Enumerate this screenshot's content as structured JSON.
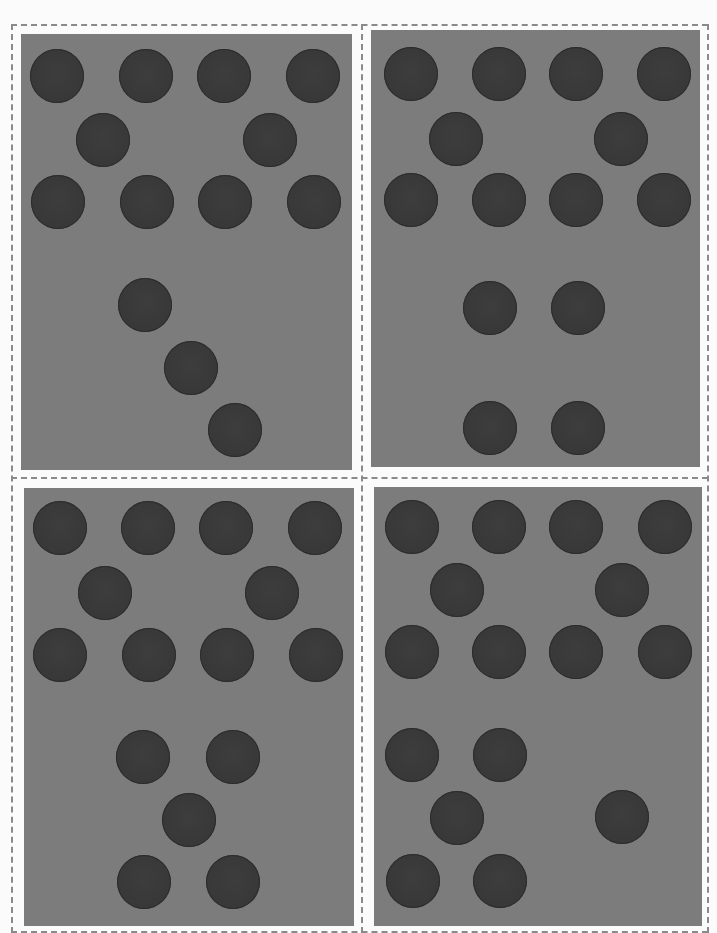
{
  "page": {
    "background": "#fbfbfb",
    "cut_line_color": "#8a8a8a",
    "card_color": "#7c7c7c",
    "dot_color": "#3a3a3a",
    "dot_diameter": 54
  },
  "cut_lines": {
    "horizontal": [
      {
        "x": 11,
        "y": 24,
        "w": 697
      },
      {
        "x": 11,
        "y": 477,
        "w": 697
      },
      {
        "x": 11,
        "y": 931,
        "w": 697
      }
    ],
    "vertical": [
      {
        "x": 11,
        "y": 24,
        "h": 909
      },
      {
        "x": 361,
        "y": 24,
        "h": 909
      },
      {
        "x": 707,
        "y": 24,
        "h": 909
      }
    ]
  },
  "cards": [
    {
      "name": "card-top-left",
      "rect": {
        "x": 21,
        "y": 34,
        "w": 331,
        "h": 436
      },
      "dot_count": 13,
      "dots": [
        [
          57,
          76
        ],
        [
          146,
          76
        ],
        [
          224,
          76
        ],
        [
          313,
          76
        ],
        [
          103,
          140
        ],
        [
          270,
          140
        ],
        [
          58,
          202
        ],
        [
          147,
          202
        ],
        [
          225,
          202
        ],
        [
          314,
          202
        ],
        [
          145,
          305
        ],
        [
          191,
          368
        ],
        [
          235,
          430
        ]
      ]
    },
    {
      "name": "card-top-right",
      "rect": {
        "x": 371,
        "y": 30,
        "w": 329,
        "h": 437
      },
      "dot_count": 14,
      "dots": [
        [
          411,
          74
        ],
        [
          499,
          74
        ],
        [
          576,
          74
        ],
        [
          664,
          74
        ],
        [
          456,
          139
        ],
        [
          621,
          139
        ],
        [
          411,
          200
        ],
        [
          499,
          200
        ],
        [
          576,
          200
        ],
        [
          664,
          200
        ],
        [
          490,
          308
        ],
        [
          578,
          308
        ],
        [
          490,
          428
        ],
        [
          578,
          428
        ]
      ]
    },
    {
      "name": "card-bottom-left",
      "rect": {
        "x": 24,
        "y": 488,
        "w": 330,
        "h": 438
      },
      "dot_count": 15,
      "dots": [
        [
          60,
          528
        ],
        [
          148,
          528
        ],
        [
          226,
          528
        ],
        [
          315,
          528
        ],
        [
          105,
          593
        ],
        [
          272,
          593
        ],
        [
          60,
          655
        ],
        [
          149,
          655
        ],
        [
          227,
          655
        ],
        [
          316,
          655
        ],
        [
          143,
          757
        ],
        [
          233,
          757
        ],
        [
          189,
          820
        ],
        [
          144,
          882
        ],
        [
          233,
          882
        ]
      ]
    },
    {
      "name": "card-bottom-right",
      "rect": {
        "x": 374,
        "y": 487,
        "w": 328,
        "h": 439
      },
      "dot_count": 16,
      "dots": [
        [
          412,
          527
        ],
        [
          499,
          527
        ],
        [
          576,
          527
        ],
        [
          665,
          527
        ],
        [
          457,
          590
        ],
        [
          622,
          590
        ],
        [
          412,
          652
        ],
        [
          499,
          652
        ],
        [
          576,
          652
        ],
        [
          665,
          652
        ],
        [
          412,
          755
        ],
        [
          500,
          755
        ],
        [
          457,
          818
        ],
        [
          622,
          817
        ],
        [
          413,
          881
        ],
        [
          500,
          881
        ]
      ]
    }
  ]
}
